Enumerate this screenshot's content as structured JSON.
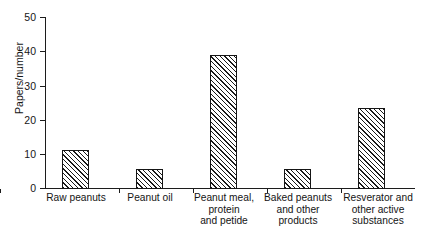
{
  "chart_data": {
    "type": "bar",
    "title": "",
    "subtitle": "",
    "xlabel": "",
    "ylabel": "Papers/number",
    "ylim": [
      0,
      50
    ],
    "yticks": [
      0,
      10,
      20,
      30,
      40,
      50
    ],
    "grid": false,
    "legend": null,
    "bar_fill": "diagonal-hatch",
    "bar_edge_color": "#151515",
    "bar_face_color": "#ffffff",
    "categories": [
      "Raw peanuts",
      "Peanut oil",
      "Peanut meal,\nprotein\nand petide",
      "Baked peanuts\nand other\nproducts",
      "Resverator and\nother active\nsubstances"
    ],
    "values": [
      11,
      5.7,
      38.8,
      5.5,
      23.4
    ]
  },
  "axis": {
    "y_title": "Papers/number",
    "y_tick_labels": [
      "0",
      "10",
      "20",
      "30",
      "40",
      "50"
    ]
  },
  "categories": {
    "c0": "Raw peanuts",
    "c1": "Peanut oil",
    "c2": "Peanut meal,\nprotein\nand petide",
    "c3": "Baked peanuts\nand other\nproducts",
    "c4": "Resverator and\nother active\nsubstances"
  }
}
